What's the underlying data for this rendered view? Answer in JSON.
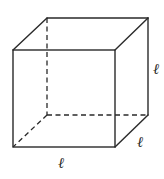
{
  "diagram": {
    "type": "cube",
    "vertices": {
      "front_top_left": [
        13,
        50
      ],
      "front_top_right": [
        115,
        50
      ],
      "front_bottom_left": [
        13,
        147
      ],
      "front_bottom_right": [
        115,
        147
      ],
      "back_top_left": [
        47,
        18
      ],
      "back_top_right": [
        148,
        18
      ],
      "back_bottom_left": [
        47,
        115
      ],
      "back_bottom_right": [
        148,
        115
      ]
    },
    "edges": {
      "visible": [
        [
          "front_top_left",
          "front_top_right"
        ],
        [
          "front_top_right",
          "front_bottom_right"
        ],
        [
          "front_bottom_right",
          "front_bottom_left"
        ],
        [
          "front_bottom_left",
          "front_top_left"
        ],
        [
          "front_top_left",
          "back_top_left"
        ],
        [
          "back_top_left",
          "back_top_right"
        ],
        [
          "back_top_right",
          "front_top_right"
        ],
        [
          "back_top_right",
          "back_bottom_right"
        ],
        [
          "back_bottom_right",
          "front_bottom_right"
        ]
      ],
      "hidden": [
        [
          "back_top_left",
          "back_bottom_left"
        ],
        [
          "back_bottom_left",
          "back_bottom_right"
        ],
        [
          "back_bottom_left",
          "front_bottom_left"
        ]
      ]
    },
    "labels": {
      "bottom_edge": "ℓ",
      "right_depth_edge": "ℓ",
      "right_vertical_edge": "ℓ"
    },
    "colors": {
      "line": "#2a2a2a",
      "background": "#ffffff"
    }
  }
}
